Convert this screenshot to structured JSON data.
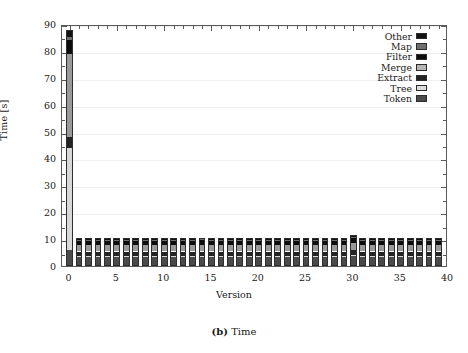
{
  "figure": {
    "caption_number": "(b)",
    "caption_text": "Time"
  },
  "chart_data": {
    "type": "bar",
    "subtype": "stacked-bar",
    "title": "",
    "xlabel": "Version",
    "ylabel": "Time [s]",
    "xlim": [
      -0.8,
      40
    ],
    "ylim": [
      0,
      90
    ],
    "ytick_labels": [
      "0",
      "10",
      "20",
      "30",
      "40",
      "50",
      "60",
      "70",
      "80",
      "90"
    ],
    "ytick_values": [
      0,
      10,
      20,
      30,
      40,
      50,
      60,
      70,
      80,
      90
    ],
    "ytick_minor_step": 5,
    "xtick_labels": [
      "0",
      "5",
      "10",
      "15",
      "20",
      "25",
      "30",
      "35",
      "40"
    ],
    "xtick_values": [
      0,
      5,
      10,
      15,
      20,
      25,
      30,
      35,
      40
    ],
    "xtick_minor_step": 1,
    "grid": "horizontal-faint",
    "legend_position": "top-right-inside",
    "categories": [
      0,
      1,
      2,
      3,
      4,
      5,
      6,
      7,
      8,
      9,
      10,
      11,
      12,
      13,
      14,
      15,
      16,
      17,
      18,
      19,
      20,
      21,
      22,
      23,
      24,
      25,
      26,
      27,
      28,
      29,
      30,
      31,
      32,
      33,
      34,
      35,
      36,
      37,
      38,
      39
    ],
    "series": [
      {
        "name": "Token",
        "color": "#4a4a4a",
        "values": [
          6.0,
          3.3,
          3.3,
          3.3,
          3.3,
          3.3,
          3.3,
          3.3,
          3.3,
          3.3,
          3.3,
          3.3,
          3.3,
          3.3,
          3.3,
          3.3,
          3.3,
          3.3,
          3.3,
          3.3,
          3.3,
          3.3,
          3.3,
          3.3,
          3.3,
          3.3,
          3.3,
          3.3,
          3.3,
          3.3,
          3.6,
          3.3,
          3.3,
          3.3,
          3.3,
          3.3,
          3.3,
          3.3,
          3.3,
          3.3
        ]
      },
      {
        "name": "Tree",
        "color": "#d8d8d8",
        "values": [
          38.0,
          0.5,
          0.5,
          0.5,
          0.5,
          0.5,
          0.5,
          0.5,
          0.5,
          0.5,
          0.5,
          0.5,
          0.5,
          0.5,
          0.5,
          0.5,
          0.5,
          0.5,
          0.5,
          0.5,
          0.5,
          0.5,
          0.5,
          0.5,
          0.5,
          0.5,
          0.5,
          0.5,
          0.5,
          0.5,
          0.6,
          0.5,
          0.5,
          0.5,
          0.5,
          0.5,
          0.5,
          0.5,
          0.5,
          0.5
        ]
      },
      {
        "name": "Extract",
        "color": "#232323",
        "values": [
          4.0,
          1.6,
          1.6,
          1.6,
          1.6,
          1.6,
          1.6,
          1.6,
          1.6,
          1.6,
          1.6,
          1.6,
          1.6,
          1.6,
          1.6,
          1.6,
          1.6,
          1.6,
          1.6,
          1.6,
          1.6,
          1.6,
          1.6,
          1.6,
          1.6,
          1.6,
          1.6,
          1.6,
          1.6,
          1.6,
          1.8,
          1.6,
          1.6,
          1.6,
          1.6,
          1.6,
          1.6,
          1.6,
          1.6,
          1.6
        ]
      },
      {
        "name": "Merge",
        "color": "#9a9a9a",
        "values": [
          31.0,
          2.4,
          2.4,
          2.4,
          2.4,
          2.4,
          2.4,
          2.4,
          2.4,
          2.4,
          2.4,
          2.4,
          2.4,
          2.4,
          2.6,
          2.4,
          2.4,
          2.4,
          2.4,
          2.4,
          2.4,
          2.4,
          2.4,
          2.4,
          2.4,
          2.4,
          2.4,
          2.4,
          2.4,
          2.4,
          2.6,
          2.4,
          2.4,
          2.4,
          2.4,
          2.4,
          2.4,
          2.4,
          2.4,
          2.4
        ]
      },
      {
        "name": "Filter",
        "color": "#0d0d0d",
        "values": [
          5.0,
          1.5,
          1.5,
          1.5,
          1.5,
          1.5,
          1.5,
          1.5,
          1.5,
          1.5,
          1.5,
          1.5,
          1.5,
          1.5,
          1.5,
          1.5,
          1.5,
          1.5,
          1.5,
          1.5,
          1.5,
          1.5,
          1.5,
          1.5,
          1.5,
          1.5,
          1.5,
          1.5,
          1.5,
          1.5,
          1.7,
          1.5,
          1.5,
          1.5,
          1.5,
          1.5,
          1.5,
          1.5,
          1.5,
          1.5
        ]
      },
      {
        "name": "Map",
        "color": "#6e6e6e",
        "values": [
          1.0,
          0.4,
          0.4,
          0.4,
          0.4,
          0.4,
          0.4,
          0.4,
          0.4,
          0.4,
          0.4,
          0.4,
          0.4,
          0.4,
          0.4,
          0.4,
          0.4,
          0.4,
          0.4,
          0.4,
          0.4,
          0.4,
          0.4,
          0.4,
          0.4,
          0.4,
          0.4,
          0.4,
          0.4,
          0.4,
          0.4,
          0.4,
          0.4,
          0.4,
          0.4,
          0.4,
          0.4,
          0.4,
          0.4,
          0.4
        ]
      },
      {
        "name": "Other",
        "color": "#111111",
        "values": [
          2.7,
          0.6,
          0.6,
          0.6,
          0.6,
          0.6,
          0.6,
          0.6,
          0.6,
          0.6,
          0.6,
          0.6,
          0.6,
          0.6,
          0.6,
          0.6,
          0.6,
          0.6,
          0.6,
          0.6,
          0.6,
          0.6,
          0.6,
          0.6,
          0.6,
          0.6,
          0.6,
          0.6,
          0.6,
          0.6,
          0.7,
          0.6,
          0.6,
          0.6,
          0.6,
          0.6,
          0.6,
          0.6,
          0.6,
          0.6
        ]
      }
    ],
    "totals": [
      87.7,
      10.3,
      10.3,
      10.3,
      10.3,
      10.3,
      10.3,
      10.3,
      10.3,
      10.3,
      10.3,
      10.3,
      10.3,
      10.3,
      10.5,
      10.3,
      10.3,
      10.3,
      10.3,
      10.3,
      10.3,
      10.3,
      10.3,
      10.3,
      10.3,
      10.3,
      10.3,
      10.3,
      10.3,
      10.3,
      11.4,
      10.3,
      10.3,
      10.3,
      10.3,
      10.3,
      10.3,
      10.3,
      10.3,
      10.3
    ]
  },
  "legend": {
    "entries": [
      {
        "label": "Other",
        "color": "#111111"
      },
      {
        "label": "Map",
        "color": "#6e6e6e"
      },
      {
        "label": "Filter",
        "color": "#0d0d0d"
      },
      {
        "label": "Merge",
        "color": "#b4b4b4"
      },
      {
        "label": "Extract",
        "color": "#232323"
      },
      {
        "label": "Tree",
        "color": "#dcdcdc"
      },
      {
        "label": "Token",
        "color": "#4a4a4a"
      }
    ]
  }
}
